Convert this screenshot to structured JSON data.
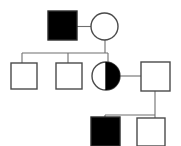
{
  "figure": {
    "kind": "pedigree-chart",
    "title": "Three-generation pedigree chart",
    "width": 181,
    "height": 146,
    "background_color": "#ffffff"
  },
  "style": {
    "stroke_color": "#4a4a4a",
    "connector_color": "#6e6e6e",
    "affected_fill": "#000000",
    "unaffected_fill": "#ffffff",
    "stroke_width": 1.4,
    "connector_width": 1.1
  },
  "legend_semantics": {
    "square": "male",
    "circle": "female",
    "filled": "affected",
    "open": "unaffected",
    "half_filled": "carrier"
  },
  "chart_data": {
    "type": "diagram",
    "title": "Three-generation pedigree chart",
    "generations": [
      {
        "id": "I",
        "label": "I",
        "individuals": [
          {
            "id": "I-1",
            "shape": "square",
            "sex": "male",
            "status": "affected",
            "fill": "full",
            "x": 48,
            "y": 11,
            "size": 29
          },
          {
            "id": "I-2",
            "shape": "circle",
            "sex": "female",
            "status": "unaffected",
            "fill": "none",
            "cx": 104.5,
            "cy": 26.5,
            "r": 13.5
          }
        ]
      },
      {
        "id": "II",
        "label": "II",
        "individuals": [
          {
            "id": "II-1",
            "shape": "square",
            "sex": "male",
            "status": "unaffected",
            "fill": "none",
            "x": 11,
            "y": 63,
            "size": 26
          },
          {
            "id": "II-2",
            "shape": "square",
            "sex": "male",
            "status": "unaffected",
            "fill": "none",
            "x": 56,
            "y": 63,
            "size": 26
          },
          {
            "id": "II-3",
            "shape": "circle",
            "sex": "female",
            "status": "carrier",
            "fill": "half-right",
            "cx": 106,
            "cy": 76,
            "r": 14
          },
          {
            "id": "II-4",
            "shape": "square",
            "sex": "male",
            "status": "unaffected",
            "fill": "none",
            "x": 141,
            "y": 62,
            "size": 29
          }
        ]
      },
      {
        "id": "III",
        "label": "III",
        "individuals": [
          {
            "id": "III-1",
            "shape": "square",
            "sex": "male",
            "status": "affected",
            "fill": "full",
            "x": 91,
            "y": 117,
            "size": 29
          },
          {
            "id": "III-2",
            "shape": "square",
            "sex": "male",
            "status": "unaffected",
            "fill": "none",
            "x": 137,
            "y": 118,
            "size": 28
          }
        ]
      }
    ],
    "matings": [
      {
        "id": "mating-1",
        "partners": [
          "I-1",
          "I-2"
        ],
        "line_y": 26.5,
        "line_x1": 77,
        "line_x2": 91,
        "descent_x": 105,
        "descent_y1": 26.5,
        "descent_y2": 53,
        "children": [
          "II-1",
          "II-2",
          "II-3"
        ],
        "sibship_y": 53,
        "sibship_x1": 22,
        "sibship_x2": 108
      },
      {
        "id": "mating-2",
        "partners": [
          "II-3",
          "II-4"
        ],
        "line_y": 76,
        "line_x1": 120,
        "line_x2": 141,
        "descent_x": 155,
        "descent_y1": 76,
        "descent_y2": 115,
        "children": [
          "III-1",
          "III-2"
        ],
        "sibship_y": 115,
        "sibship_x1": 105,
        "sibship_x2": 155
      }
    ],
    "child_drops": [
      {
        "id": "drop-II-1",
        "x": 22,
        "y1": 53,
        "y2": 63
      },
      {
        "id": "drop-II-2",
        "x": 68,
        "y1": 53,
        "y2": 63
      },
      {
        "id": "drop-II-3",
        "x": 108,
        "y1": 53,
        "y2": 63
      },
      {
        "id": "drop-III-1",
        "x": 105,
        "y1": 115,
        "y2": 117
      },
      {
        "id": "drop-III-2",
        "x": 155,
        "y1": 115,
        "y2": 118
      }
    ]
  }
}
